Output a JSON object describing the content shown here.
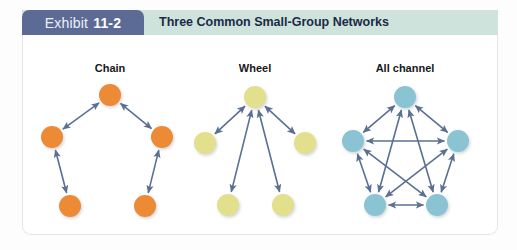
{
  "header": {
    "badge_word": "Exhibit",
    "badge_number": "11-2",
    "title": "Three Common Small-Group Networks",
    "badge_color": "#5c6b96",
    "title_bar_color": "#cfe3dd",
    "title_text_color": "#1b2a44"
  },
  "panel": {
    "background": "#ffffff",
    "border_color": "#e6e6ea"
  },
  "networks": [
    {
      "id": "chain",
      "label": "Chain",
      "label_x": 110,
      "label_y": 62,
      "node_color": "#ec8a35",
      "node_radius": 11,
      "nodes": [
        {
          "name": "chain-node-top",
          "x": 110,
          "y": 95
        },
        {
          "name": "chain-node-mid-left",
          "x": 52,
          "y": 137
        },
        {
          "name": "chain-node-mid-right",
          "x": 162,
          "y": 137
        },
        {
          "name": "chain-node-bottom-left",
          "x": 70,
          "y": 206
        },
        {
          "name": "chain-node-bottom-right",
          "x": 145,
          "y": 206
        }
      ],
      "edges": [
        {
          "from": 0,
          "to": 1
        },
        {
          "from": 0,
          "to": 2
        },
        {
          "from": 1,
          "to": 3
        },
        {
          "from": 2,
          "to": 4
        }
      ]
    },
    {
      "id": "wheel",
      "label": "Wheel",
      "label_x": 255,
      "label_y": 62,
      "node_color": "#e2e08c",
      "node_radius": 11,
      "nodes": [
        {
          "name": "wheel-node-hub",
          "x": 255,
          "y": 97
        },
        {
          "name": "wheel-node-left",
          "x": 205,
          "y": 143
        },
        {
          "name": "wheel-node-right",
          "x": 305,
          "y": 143
        },
        {
          "name": "wheel-node-bottom-left",
          "x": 228,
          "y": 205
        },
        {
          "name": "wheel-node-bottom-right",
          "x": 283,
          "y": 205
        }
      ],
      "edges": [
        {
          "from": 0,
          "to": 1
        },
        {
          "from": 0,
          "to": 2
        },
        {
          "from": 0,
          "to": 3
        },
        {
          "from": 0,
          "to": 4
        }
      ]
    },
    {
      "id": "all-channel",
      "label": "All channel",
      "label_x": 405,
      "label_y": 62,
      "node_color": "#8ac4d2",
      "node_radius": 11,
      "nodes": [
        {
          "name": "allchannel-node-top",
          "x": 405,
          "y": 97
        },
        {
          "name": "allchannel-node-left",
          "x": 353,
          "y": 141
        },
        {
          "name": "allchannel-node-right",
          "x": 458,
          "y": 141
        },
        {
          "name": "allchannel-node-bottom-left",
          "x": 375,
          "y": 205
        },
        {
          "name": "allchannel-node-bottom-right",
          "x": 437,
          "y": 205
        }
      ],
      "edges": [
        {
          "from": 0,
          "to": 1
        },
        {
          "from": 0,
          "to": 2
        },
        {
          "from": 0,
          "to": 3
        },
        {
          "from": 0,
          "to": 4
        },
        {
          "from": 1,
          "to": 2
        },
        {
          "from": 1,
          "to": 3
        },
        {
          "from": 1,
          "to": 4
        },
        {
          "from": 2,
          "to": 3
        },
        {
          "from": 2,
          "to": 4
        },
        {
          "from": 3,
          "to": 4
        }
      ]
    }
  ],
  "style": {
    "arrow_color": "#5b6f93",
    "arrow_width": 1.6
  }
}
